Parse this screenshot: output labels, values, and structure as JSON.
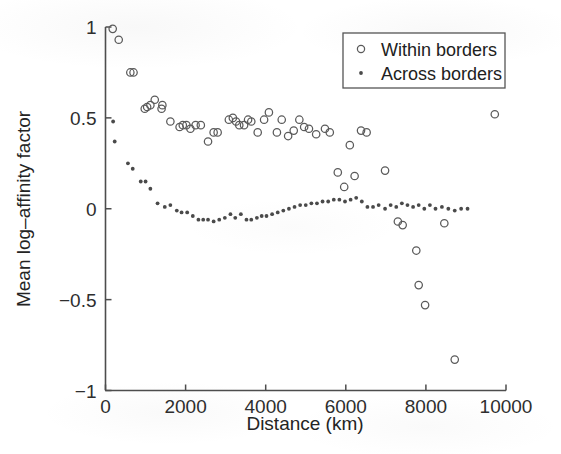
{
  "chart_data": {
    "type": "scatter",
    "title": "",
    "xlabel": "Distance (km)",
    "ylabel": "Mean log–affinity factor",
    "xlim": [
      0,
      10000
    ],
    "ylim": [
      -1,
      1
    ],
    "xticks": [
      0,
      2000,
      4000,
      6000,
      8000,
      10000
    ],
    "xticklabels": [
      "0",
      "2000",
      "4000",
      "6000",
      "8000",
      "10000"
    ],
    "yticks": [
      -1,
      -0.5,
      0,
      0.5,
      1
    ],
    "yticklabels": [
      "-1",
      "-0.5",
      "0",
      "0.5",
      "1"
    ],
    "grid": false,
    "legend_position": "top-right",
    "series": [
      {
        "name": "Within borders",
        "marker": "open-circle",
        "color": "#5a5a5a",
        "points": [
          [
            180,
            0.99
          ],
          [
            330,
            0.93
          ],
          [
            620,
            0.75
          ],
          [
            700,
            0.75
          ],
          [
            980,
            0.55
          ],
          [
            1040,
            0.56
          ],
          [
            1120,
            0.57
          ],
          [
            1230,
            0.6
          ],
          [
            1400,
            0.55
          ],
          [
            1420,
            0.57
          ],
          [
            1620,
            0.48
          ],
          [
            1850,
            0.45
          ],
          [
            1930,
            0.46
          ],
          [
            2020,
            0.46
          ],
          [
            2120,
            0.44
          ],
          [
            2250,
            0.46
          ],
          [
            2380,
            0.46
          ],
          [
            2560,
            0.37
          ],
          [
            2700,
            0.42
          ],
          [
            2800,
            0.42
          ],
          [
            3080,
            0.49
          ],
          [
            3180,
            0.5
          ],
          [
            3260,
            0.48
          ],
          [
            3340,
            0.46
          ],
          [
            3460,
            0.46
          ],
          [
            3560,
            0.49
          ],
          [
            3640,
            0.48
          ],
          [
            3800,
            0.42
          ],
          [
            3960,
            0.49
          ],
          [
            4080,
            0.53
          ],
          [
            4280,
            0.42
          ],
          [
            4400,
            0.49
          ],
          [
            4560,
            0.4
          ],
          [
            4700,
            0.43
          ],
          [
            4840,
            0.49
          ],
          [
            4960,
            0.45
          ],
          [
            5080,
            0.44
          ],
          [
            5260,
            0.41
          ],
          [
            5480,
            0.44
          ],
          [
            5600,
            0.42
          ],
          [
            5800,
            0.2
          ],
          [
            5960,
            0.12
          ],
          [
            6100,
            0.35
          ],
          [
            6220,
            0.18
          ],
          [
            6380,
            0.43
          ],
          [
            6520,
            0.42
          ],
          [
            6980,
            0.21
          ],
          [
            7300,
            -0.07
          ],
          [
            7420,
            -0.09
          ],
          [
            7760,
            -0.23
          ],
          [
            7820,
            -0.42
          ],
          [
            7980,
            -0.53
          ],
          [
            8460,
            -0.08
          ],
          [
            8720,
            -0.83
          ],
          [
            9720,
            0.52
          ]
        ]
      },
      {
        "name": "Across borders",
        "marker": "dot",
        "color": "#4a4a4a",
        "points": [
          [
            190,
            0.48
          ],
          [
            230,
            0.37
          ],
          [
            560,
            0.25
          ],
          [
            680,
            0.22
          ],
          [
            880,
            0.15
          ],
          [
            1000,
            0.15
          ],
          [
            1120,
            0.11
          ],
          [
            1300,
            0.03
          ],
          [
            1480,
            0.01
          ],
          [
            1620,
            0.02
          ],
          [
            1780,
            -0.01
          ],
          [
            1900,
            -0.02
          ],
          [
            2040,
            -0.02
          ],
          [
            2180,
            -0.04
          ],
          [
            2320,
            -0.06
          ],
          [
            2440,
            -0.06
          ],
          [
            2560,
            -0.06
          ],
          [
            2700,
            -0.07
          ],
          [
            2840,
            -0.06
          ],
          [
            2980,
            -0.05
          ],
          [
            3120,
            -0.03
          ],
          [
            3240,
            -0.05
          ],
          [
            3380,
            -0.03
          ],
          [
            3520,
            -0.06
          ],
          [
            3640,
            -0.06
          ],
          [
            3780,
            -0.05
          ],
          [
            3900,
            -0.04
          ],
          [
            4020,
            -0.04
          ],
          [
            4160,
            -0.03
          ],
          [
            4300,
            -0.02
          ],
          [
            4440,
            -0.01
          ],
          [
            4580,
            0.0
          ],
          [
            4720,
            0.01
          ],
          [
            4860,
            0.02
          ],
          [
            5000,
            0.02
          ],
          [
            5140,
            0.03
          ],
          [
            5280,
            0.03
          ],
          [
            5420,
            0.04
          ],
          [
            5560,
            0.04
          ],
          [
            5700,
            0.05
          ],
          [
            5840,
            0.05
          ],
          [
            5980,
            0.04
          ],
          [
            6120,
            0.05
          ],
          [
            6260,
            0.06
          ],
          [
            6400,
            0.04
          ],
          [
            6540,
            0.01
          ],
          [
            6680,
            0.01
          ],
          [
            6820,
            0.02
          ],
          [
            6980,
            0.0
          ],
          [
            7120,
            0.02
          ],
          [
            7260,
            0.01
          ],
          [
            7400,
            0.03
          ],
          [
            7540,
            0.02
          ],
          [
            7680,
            0.01
          ],
          [
            7820,
            0.02
          ],
          [
            7960,
            0.0
          ],
          [
            8100,
            0.02
          ],
          [
            8240,
            0.0
          ],
          [
            8400,
            0.01
          ],
          [
            8560,
            0.0
          ],
          [
            8720,
            -0.01
          ],
          [
            8880,
            0.0
          ],
          [
            9040,
            0.0
          ]
        ]
      }
    ]
  },
  "legend": {
    "entries": [
      {
        "label": "Within borders",
        "marker": "open-circle"
      },
      {
        "label": "Across borders",
        "marker": "dot"
      }
    ]
  },
  "colors": {
    "axis": "#4d4d4d",
    "text": "#242424",
    "background": "#ffffff"
  }
}
